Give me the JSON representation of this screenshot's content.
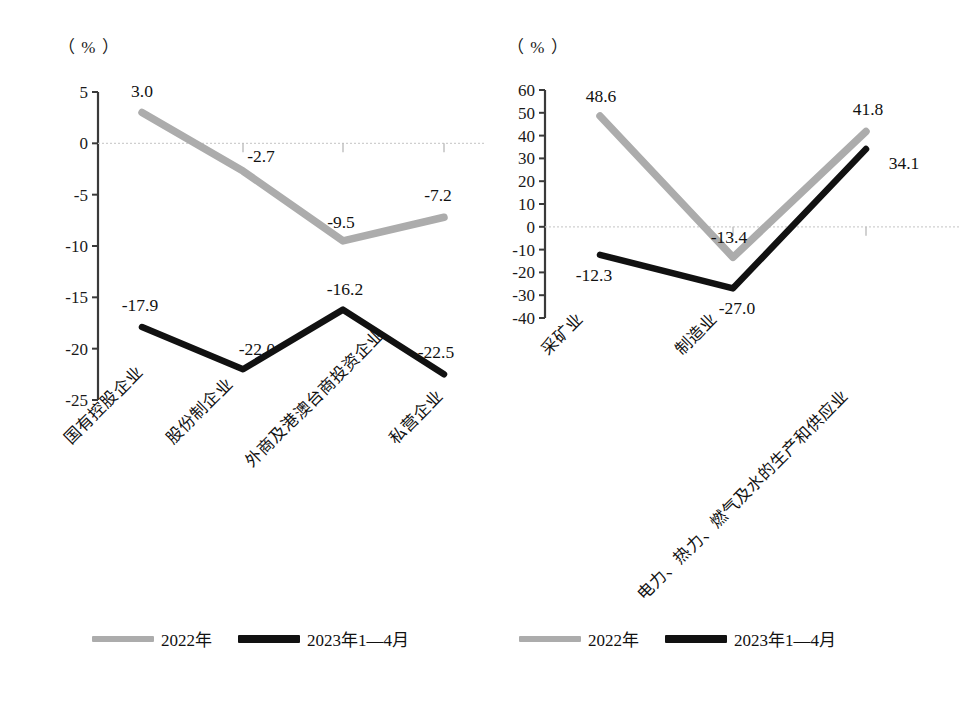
{
  "unit_label": "（ % ）",
  "legend": {
    "items": [
      {
        "label": "2022年",
        "color": "#acacac"
      },
      {
        "label": "2023年1—4月",
        "color": "#111111"
      }
    ]
  },
  "chart_data": [
    {
      "type": "line",
      "title": "",
      "xlabel": "",
      "ylabel": "（ % ）",
      "ylim": [
        -25,
        5
      ],
      "yticks": [
        "5",
        "0",
        "-5",
        "-10",
        "-15",
        "-20",
        "-25"
      ],
      "grid": false,
      "zero_line": true,
      "legend_position": "bottom",
      "categories": [
        "国有控股企业",
        "股份制企业",
        "外商及港澳台商投资企业",
        "私营企业"
      ],
      "series": [
        {
          "name": "2022年",
          "color": "#acacac",
          "values": [
            3.0,
            -2.7,
            -9.5,
            -7.2
          ],
          "labels": [
            "3.0",
            "-2.7",
            "-9.5",
            "-7.2"
          ]
        },
        {
          "name": "2023年1—4月",
          "color": "#111111",
          "values": [
            -17.9,
            -22.0,
            -16.2,
            -22.5
          ],
          "labels": [
            "-17.9",
            "-22.0",
            "-16.2",
            "-22.5"
          ]
        }
      ]
    },
    {
      "type": "line",
      "title": "",
      "xlabel": "",
      "ylabel": "（ % ）",
      "ylim": [
        -40,
        60
      ],
      "yticks": [
        "60",
        "50",
        "40",
        "30",
        "20",
        "10",
        "0",
        "-10",
        "-20",
        "-30",
        "-40"
      ],
      "grid": false,
      "zero_line": true,
      "legend_position": "bottom",
      "categories": [
        "采矿业",
        "制造业",
        "电力、热力、燃气及水的生产和供应业"
      ],
      "series": [
        {
          "name": "2022年",
          "color": "#acacac",
          "values": [
            48.6,
            -13.4,
            41.8
          ],
          "labels": [
            "48.6",
            "-13.4",
            "41.8"
          ]
        },
        {
          "name": "2023年1—4月",
          "color": "#111111",
          "values": [
            -12.3,
            -27.0,
            34.1
          ],
          "labels": [
            "-12.3",
            "-27.0",
            "34.1"
          ]
        }
      ]
    }
  ]
}
